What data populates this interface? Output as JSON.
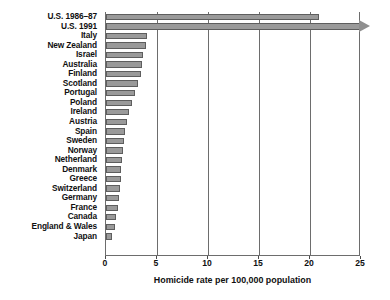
{
  "chart_data": {
    "type": "bar",
    "orientation": "horizontal",
    "title": "",
    "xlabel": "Homicide rate per 100,000 population",
    "ylabel": "",
    "xlim": [
      0,
      25
    ],
    "xticks": [
      0,
      5,
      10,
      15,
      20,
      25
    ],
    "xtick_labels": [
      "0",
      "5",
      "10",
      "15",
      "20",
      "25"
    ],
    "grid": "vertical",
    "legend": "none",
    "bar_color": "#9a9a9a",
    "bar_edge_color": "#5e5e5e",
    "axis_color": "#6d6d6d",
    "categories": [
      "U.S. 1986–87",
      "U.S. 1991",
      "Italy",
      "New Zealand",
      "Israel",
      "Australia",
      "Finland",
      "Scotland",
      "Portugal",
      "Poland",
      "Ireland",
      "Austria",
      "Spain",
      "Sweden",
      "Norway",
      "Netherland",
      "Denmark",
      "Greece",
      "Switzerland",
      "Germany",
      "France",
      "Canada",
      "England & Wales",
      "Japan"
    ],
    "values": [
      20.9,
      26.2,
      4.0,
      3.9,
      3.6,
      3.5,
      3.4,
      3.1,
      2.8,
      2.5,
      2.3,
      2.1,
      1.9,
      1.8,
      1.7,
      1.6,
      1.5,
      1.45,
      1.4,
      1.25,
      1.2,
      1.0,
      0.9,
      0.6
    ],
    "truncated_bars": [
      {
        "category": "U.S. 1991",
        "note": "bar extends past axis maximum, drawn with arrowhead"
      }
    ]
  }
}
